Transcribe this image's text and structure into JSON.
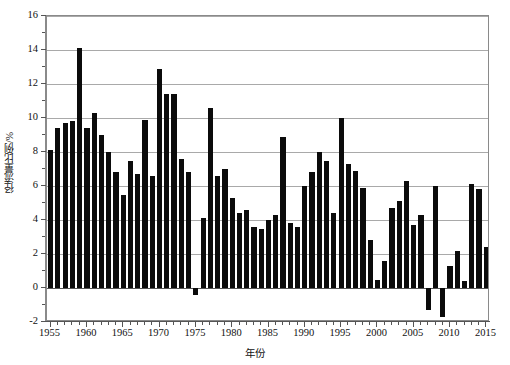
{
  "chart_data": {
    "type": "bar",
    "title": "",
    "xlabel": "年份",
    "ylabel": "径流量比例/%",
    "xlim": [
      1954.5,
      2015.5
    ],
    "ylim": [
      -2,
      16
    ],
    "yticks": [
      -2,
      0,
      2,
      4,
      6,
      8,
      10,
      12,
      14,
      16
    ],
    "ytick_labels": [
      "-2",
      "0",
      "2",
      "4",
      "6",
      "8",
      "10",
      "12",
      "14",
      "16"
    ],
    "xticks": [
      1955,
      1960,
      1965,
      1970,
      1975,
      1980,
      1985,
      1990,
      1995,
      2000,
      2005,
      2010,
      2015
    ],
    "xtick_labels": [
      "1955",
      "1960",
      "1965",
      "1970",
      "1975",
      "1980",
      "1985",
      "1990",
      "1995",
      "2000",
      "2005",
      "2010",
      "2015"
    ],
    "grid": true,
    "grid_axis": "y",
    "legend": null,
    "bar_color": "#0b0b0b",
    "categories": [
      1955,
      1956,
      1957,
      1958,
      1959,
      1960,
      1961,
      1962,
      1963,
      1964,
      1965,
      1966,
      1967,
      1968,
      1969,
      1970,
      1971,
      1972,
      1973,
      1974,
      1975,
      1976,
      1977,
      1978,
      1979,
      1980,
      1981,
      1982,
      1983,
      1984,
      1985,
      1986,
      1987,
      1988,
      1989,
      1990,
      1991,
      1992,
      1993,
      1994,
      1995,
      1996,
      1997,
      1998,
      1999,
      2000,
      2001,
      2002,
      2003,
      2004,
      2005,
      2006,
      2007,
      2008,
      2009,
      2010,
      2011,
      2012,
      2013,
      2014,
      2015
    ],
    "values": [
      8.1,
      9.4,
      9.7,
      9.8,
      14.1,
      9.4,
      10.3,
      9.0,
      8.0,
      6.8,
      5.5,
      7.5,
      6.7,
      9.9,
      6.6,
      12.9,
      11.4,
      11.4,
      7.6,
      6.8,
      -0.4,
      4.1,
      10.6,
      6.6,
      7.0,
      5.3,
      4.4,
      4.6,
      3.6,
      3.5,
      4.0,
      4.3,
      8.9,
      3.8,
      3.6,
      6.0,
      6.8,
      8.0,
      7.5,
      4.4,
      10.0,
      7.3,
      6.9,
      5.9,
      2.8,
      0.5,
      1.6,
      4.7,
      5.1,
      6.3,
      3.7,
      4.3,
      -1.3,
      6.0,
      -1.7,
      1.3,
      2.2,
      0.4,
      6.1,
      5.8,
      2.4
    ]
  }
}
